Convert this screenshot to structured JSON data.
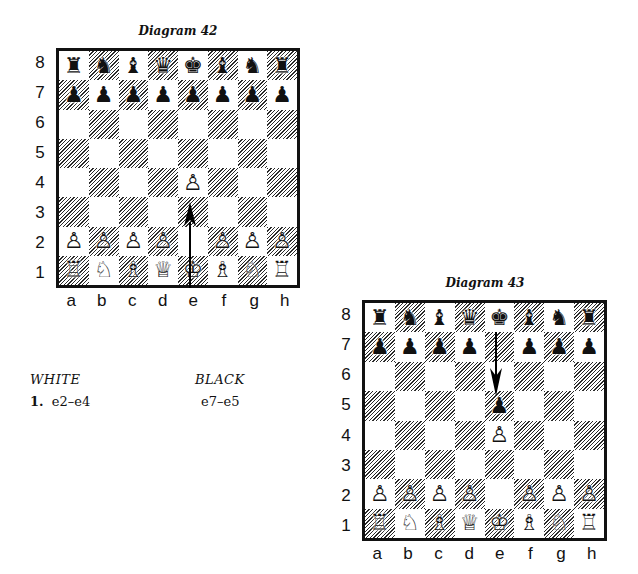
{
  "diagrams": [
    {
      "title": "Diagram 42",
      "ranks": [
        "8",
        "7",
        "6",
        "5",
        "4",
        "3",
        "2",
        "1"
      ],
      "files": [
        "a",
        "b",
        "c",
        "d",
        "e",
        "f",
        "g",
        "h"
      ],
      "position": [
        [
          "♜",
          "♞",
          "♝",
          "♛",
          "♚",
          "♝",
          "♞",
          "♜"
        ],
        [
          "♟",
          "♟",
          "♟",
          "♟",
          "♟",
          "♟",
          "♟",
          "♟"
        ],
        [
          "",
          "",
          "",
          "",
          "",
          "",
          "",
          ""
        ],
        [
          "",
          "",
          "",
          "",
          "",
          "",
          "",
          ""
        ],
        [
          "",
          "",
          "",
          "",
          "♙",
          "",
          "",
          ""
        ],
        [
          "",
          "",
          "",
          "",
          "",
          "",
          "",
          ""
        ],
        [
          "♙",
          "♙",
          "♙",
          "♙",
          "",
          "♙",
          "♙",
          "♙"
        ],
        [
          "♖",
          "♘",
          "♗",
          "♕",
          "♔",
          "♗",
          "♘",
          "♖"
        ]
      ],
      "arrow": {
        "from": "e2",
        "to": "e4",
        "direction": "up"
      }
    },
    {
      "title": "Diagram 43",
      "ranks": [
        "8",
        "7",
        "6",
        "5",
        "4",
        "3",
        "2",
        "1"
      ],
      "files": [
        "a",
        "b",
        "c",
        "d",
        "e",
        "f",
        "g",
        "h"
      ],
      "position": [
        [
          "♜",
          "♞",
          "♝",
          "♛",
          "♚",
          "♝",
          "♞",
          "♜"
        ],
        [
          "♟",
          "♟",
          "♟",
          "♟",
          "",
          "♟",
          "♟",
          "♟"
        ],
        [
          "",
          "",
          "",
          "",
          "",
          "",
          "",
          ""
        ],
        [
          "",
          "",
          "",
          "",
          "♟",
          "",
          "",
          ""
        ],
        [
          "",
          "",
          "",
          "",
          "♙",
          "",
          "",
          ""
        ],
        [
          "",
          "",
          "",
          "",
          "",
          "",
          "",
          ""
        ],
        [
          "♙",
          "♙",
          "♙",
          "♙",
          "",
          "♙",
          "♙",
          "♙"
        ],
        [
          "♖",
          "♘",
          "♗",
          "♕",
          "♔",
          "♗",
          "♘",
          "♖"
        ]
      ],
      "arrow": {
        "from": "e7",
        "to": "e5",
        "direction": "down"
      }
    }
  ],
  "moves": {
    "white_header": "WHITE",
    "black_header": "BLACK",
    "list": [
      {
        "number": "1.",
        "white": "e2–e4",
        "black": "e7–e5"
      }
    ]
  },
  "colors": {
    "ink": "#111111",
    "paper": "#ffffff"
  }
}
